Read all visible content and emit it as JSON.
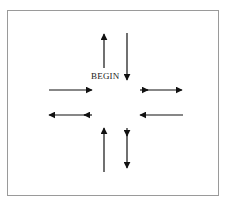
{
  "diagram": {
    "label": "BEGIN",
    "colors": {
      "arrow": "#111111",
      "frame": "#9a9a9a",
      "background": "#ffffff"
    },
    "arrows": [
      {
        "name": "arrow-up-top-left",
        "direction": "up",
        "heads": 1
      },
      {
        "name": "arrow-down-top-right",
        "direction": "down",
        "heads": 1
      },
      {
        "name": "arrow-right-middle-left",
        "direction": "right",
        "heads": 1
      },
      {
        "name": "arrow-right-middle-right",
        "direction": "right",
        "heads": 2
      },
      {
        "name": "arrow-left-lower-left",
        "direction": "left",
        "heads": 2
      },
      {
        "name": "arrow-left-lower-right",
        "direction": "left",
        "heads": 1
      },
      {
        "name": "arrow-up-bottom-left",
        "direction": "up",
        "heads": 1
      },
      {
        "name": "arrow-down-bottom-right",
        "direction": "down",
        "heads": 2
      }
    ]
  }
}
